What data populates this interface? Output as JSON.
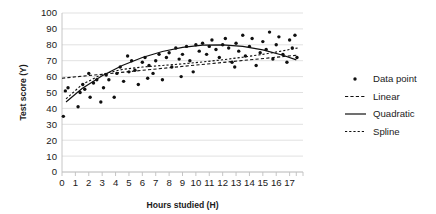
{
  "chart_data": {
    "type": "scatter",
    "title": "",
    "xlabel": "Hours studied (H)",
    "ylabel": "Test score (Y)",
    "xlim": [
      0,
      18
    ],
    "ylim": [
      0,
      100
    ],
    "xticks": [
      0,
      1,
      2,
      3,
      4,
      5,
      6,
      7,
      8,
      9,
      10,
      11,
      12,
      13,
      14,
      15,
      16,
      17
    ],
    "yticks": [
      0,
      10,
      20,
      30,
      40,
      50,
      60,
      70,
      80,
      90,
      100
    ],
    "grid": "horizontal",
    "legend_position": "right",
    "legend": [
      {
        "label": "Data point",
        "marker": "dot",
        "style": "none"
      },
      {
        "label": "Linear",
        "marker": "line",
        "style": "fine-dashed"
      },
      {
        "label": "Quadratic",
        "marker": "line",
        "style": "solid"
      },
      {
        "label": "Spline",
        "marker": "line",
        "style": "dashed"
      }
    ],
    "series": [
      {
        "name": "Data point",
        "type": "scatter",
        "points": [
          [
            0.1,
            35
          ],
          [
            0.25,
            51
          ],
          [
            0.45,
            53
          ],
          [
            1.2,
            41
          ],
          [
            1.35,
            50
          ],
          [
            1.55,
            55
          ],
          [
            1.7,
            52
          ],
          [
            2.1,
            47
          ],
          [
            2.35,
            56
          ],
          [
            2.6,
            58
          ],
          [
            2.9,
            44
          ],
          [
            3.1,
            53
          ],
          [
            3.3,
            61
          ],
          [
            3.5,
            58
          ],
          [
            3.9,
            47
          ],
          [
            4.1,
            62
          ],
          [
            4.35,
            66
          ],
          [
            4.6,
            57
          ],
          [
            5.0,
            63
          ],
          [
            5.2,
            70
          ],
          [
            5.45,
            64
          ],
          [
            5.7,
            55
          ],
          [
            6.0,
            69
          ],
          [
            6.2,
            72
          ],
          [
            6.5,
            67
          ],
          [
            6.8,
            62
          ],
          [
            7.0,
            70
          ],
          [
            7.25,
            74
          ],
          [
            7.5,
            58
          ],
          [
            7.8,
            72
          ],
          [
            8.0,
            75
          ],
          [
            8.2,
            66
          ],
          [
            8.5,
            78
          ],
          [
            8.75,
            71
          ],
          [
            9.0,
            74
          ],
          [
            9.3,
            79
          ],
          [
            9.55,
            70
          ],
          [
            9.8,
            63
          ],
          [
            10.0,
            80
          ],
          [
            10.25,
            76
          ],
          [
            10.5,
            81
          ],
          [
            10.8,
            74
          ],
          [
            11.0,
            79
          ],
          [
            11.2,
            83
          ],
          [
            11.5,
            77
          ],
          [
            11.75,
            72
          ],
          [
            12.0,
            80
          ],
          [
            12.2,
            84
          ],
          [
            12.45,
            78
          ],
          [
            12.7,
            69
          ],
          [
            13.0,
            81
          ],
          [
            13.2,
            76
          ],
          [
            13.5,
            86
          ],
          [
            13.7,
            73
          ],
          [
            14.0,
            79
          ],
          [
            14.2,
            84
          ],
          [
            14.5,
            67
          ],
          [
            14.8,
            75
          ],
          [
            15.0,
            82
          ],
          [
            15.25,
            77
          ],
          [
            15.5,
            88
          ],
          [
            15.75,
            71
          ],
          [
            16.0,
            80
          ],
          [
            16.2,
            85
          ],
          [
            16.5,
            74
          ],
          [
            16.8,
            69
          ],
          [
            17.0,
            83
          ],
          [
            17.2,
            78
          ],
          [
            17.4,
            86
          ],
          [
            17.55,
            72
          ],
          [
            4.9,
            73
          ],
          [
            8.9,
            60
          ],
          [
            12.9,
            66
          ],
          [
            6.4,
            59
          ],
          [
            2.0,
            62
          ]
        ]
      },
      {
        "name": "Linear",
        "type": "line",
        "style": "fine-dashed",
        "points": [
          [
            0,
            59.0
          ],
          [
            17.6,
            73.5
          ]
        ]
      },
      {
        "name": "Quadratic",
        "type": "line",
        "style": "solid",
        "points": [
          [
            0.3,
            44.0
          ],
          [
            1.5,
            52.5
          ],
          [
            3.0,
            60.5
          ],
          [
            4.5,
            67.0
          ],
          [
            6.0,
            72.0
          ],
          [
            7.5,
            75.8
          ],
          [
            9.0,
            78.4
          ],
          [
            10.5,
            79.8
          ],
          [
            12.0,
            80.0
          ],
          [
            13.5,
            79.0
          ],
          [
            15.0,
            76.8
          ],
          [
            16.5,
            73.4
          ],
          [
            17.5,
            70.5
          ]
        ]
      },
      {
        "name": "Spline",
        "type": "line",
        "style": "dashed",
        "points": [
          [
            0.3,
            46.0
          ],
          [
            1.5,
            55.0
          ],
          [
            3.0,
            61.5
          ],
          [
            4.5,
            64.5
          ],
          [
            6.0,
            66.0
          ],
          [
            7.5,
            67.0
          ],
          [
            9.0,
            68.0
          ],
          [
            10.5,
            69.2
          ],
          [
            12.0,
            70.6
          ],
          [
            13.5,
            72.2
          ],
          [
            15.0,
            74.0
          ],
          [
            16.5,
            76.2
          ],
          [
            17.6,
            78.0
          ]
        ]
      }
    ]
  }
}
